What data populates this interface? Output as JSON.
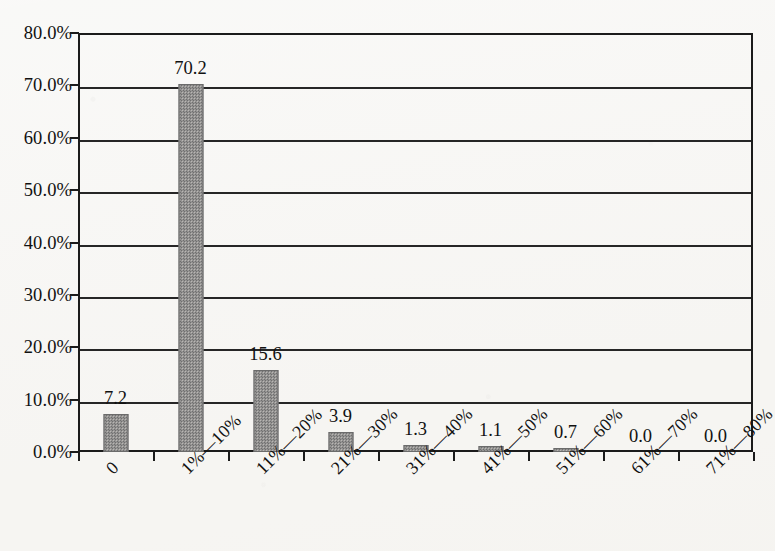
{
  "chart_data": {
    "type": "bar",
    "title": "",
    "subtitle": "",
    "xlabel": "",
    "ylabel": "",
    "categories": [
      "0",
      "1%—10%",
      "11%—20%",
      "21%—30%",
      "31%—40%",
      "41%—50%",
      "51%—60%",
      "61%—70%",
      "71%—80%"
    ],
    "values": [
      7.2,
      70.2,
      15.6,
      3.9,
      1.3,
      1.1,
      0.7,
      0.0,
      0.0
    ],
    "data_labels": [
      "7.2",
      "70.2",
      "15.6",
      "3.9",
      "1.3",
      "1.1",
      "0.7",
      "0.0",
      "0.0"
    ],
    "ylim": [
      0,
      80
    ],
    "ytick_values": [
      0,
      10,
      20,
      30,
      40,
      50,
      60,
      70,
      80
    ],
    "ytick_labels": [
      "0.0%",
      "10.0%",
      "20.0%",
      "30.0%",
      "40.0%",
      "50.0%",
      "60.0%",
      "70.0%",
      "80.0%"
    ],
    "grid": true,
    "legend": "none",
    "series_name": "",
    "bar_color": "#8d8d8d",
    "axis_color": "#1b1b1b",
    "background_color": "#f6f5f2",
    "xtick_label_rotation": -45
  }
}
